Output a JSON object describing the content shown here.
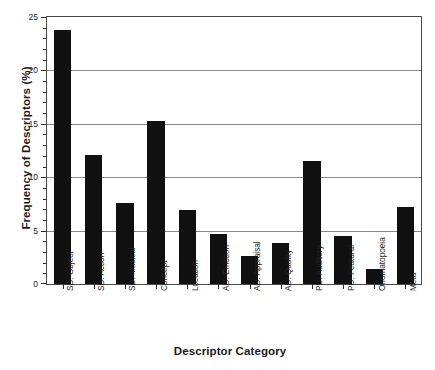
{
  "chart_data": {
    "type": "bar",
    "title": "",
    "xlabel": "Descriptor Category",
    "ylabel": "Frequency of Descriptors (%)",
    "categories": [
      "SD: Object",
      "SD: Action",
      "SD: Musical",
      "Concept",
      "Location",
      "AD: Emotion",
      "AD: Appraisal",
      "AD: Quality",
      "PD: Auditory",
      "PD: Featural",
      "Onomatopoeia",
      "Meta"
    ],
    "values": [
      23.8,
      12.1,
      7.6,
      15.3,
      6.9,
      4.7,
      2.6,
      3.8,
      11.5,
      4.5,
      1.4,
      7.2
    ],
    "ylim": [
      0,
      25
    ],
    "yticks": [
      0,
      5,
      10,
      15,
      20,
      25
    ],
    "ytick_labels": [
      "0",
      "5",
      "10",
      "15",
      "20",
      "25"
    ],
    "grid": true,
    "grid_axis": "y",
    "legend": false,
    "bar_color": "#101010",
    "axis_color": "#4a4a4a",
    "grid_color": "#888888"
  }
}
